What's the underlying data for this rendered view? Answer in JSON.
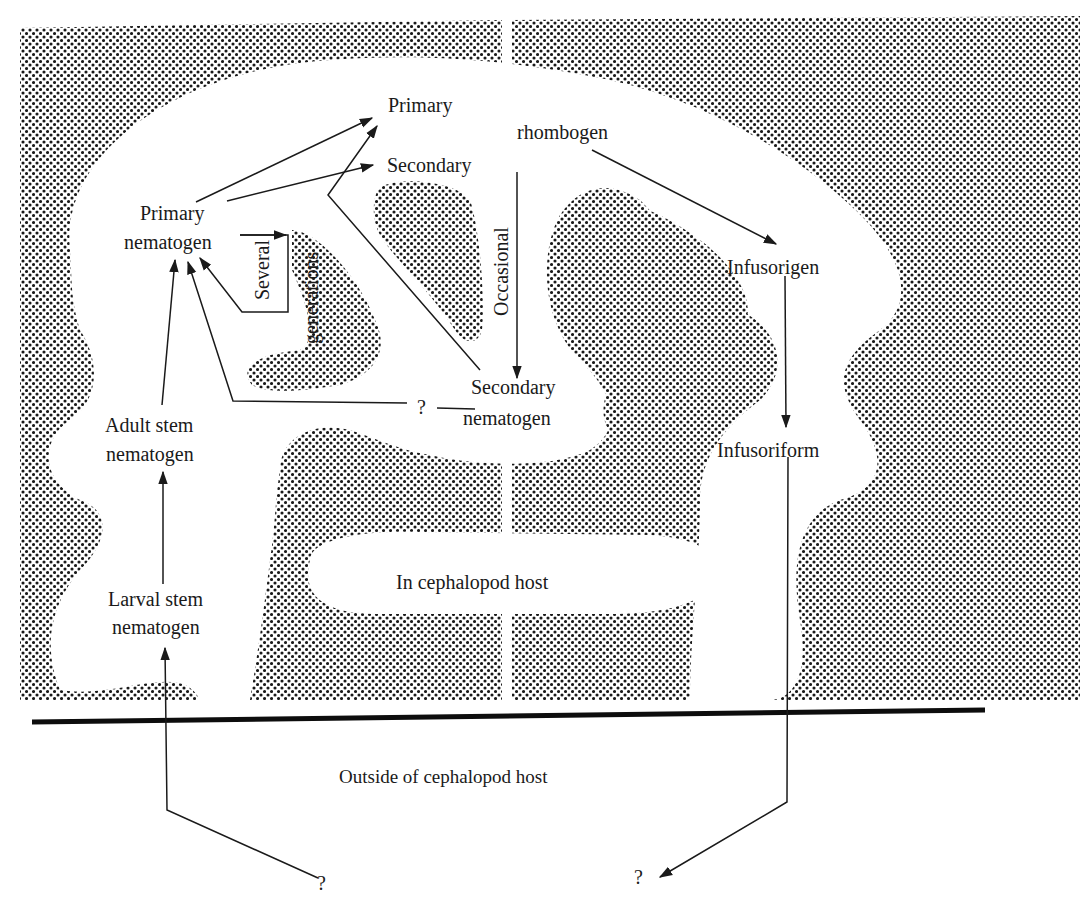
{
  "diagram": {
    "type": "life-cycle",
    "colors": {
      "stipple": "#1a1a1a",
      "background": "#ffffff",
      "line": "#1a1a1a"
    },
    "regions": {
      "inside": "In cephalopod host",
      "outside": "Outside of cephalopod host"
    },
    "nodes": {
      "primary_top": "Primary",
      "rhombogen": "rhombogen",
      "secondary_top": "Secondary",
      "primary_nematogen_1": "Primary",
      "primary_nematogen_2": "nematogen",
      "infusorigen": "Infusorigen",
      "secondary_nematogen_1": "Secondary",
      "secondary_nematogen_2": "nematogen",
      "adult_stem_1": "Adult stem",
      "adult_stem_2": "nematogen",
      "infusoriform": "Infusoriform",
      "larval_stem_1": "Larval stem",
      "larval_stem_2": "nematogen",
      "unknown_mid": "?",
      "unknown_bottom_left": "?",
      "unknown_bottom_right": "?"
    },
    "edge_labels": {
      "several": "Several",
      "generations": "generations",
      "occasional": "Occasional"
    },
    "edges": [
      {
        "from": "Primary nematogen",
        "to": "Primary rhombogen"
      },
      {
        "from": "Primary nematogen",
        "to": "Secondary rhombogen"
      },
      {
        "from": "Secondary nematogen",
        "to": "Primary rhombogen"
      },
      {
        "from": "Primary nematogen",
        "to": "Primary nematogen",
        "label": "Several generations"
      },
      {
        "from": "Primary/Secondary rhombogen",
        "to": "Secondary nematogen",
        "label": "Occasional"
      },
      {
        "from": "Secondary nematogen",
        "to": "Primary nematogen",
        "label": "?"
      },
      {
        "from": "Adult stem nematogen",
        "to": "Primary nematogen"
      },
      {
        "from": "Larval stem nematogen",
        "to": "Adult stem nematogen"
      },
      {
        "from": "?",
        "to": "Larval stem nematogen"
      },
      {
        "from": "rhombogen",
        "to": "Infusorigen"
      },
      {
        "from": "Infusorigen",
        "to": "Infusoriform"
      },
      {
        "from": "Infusoriform",
        "to": "?"
      }
    ]
  }
}
